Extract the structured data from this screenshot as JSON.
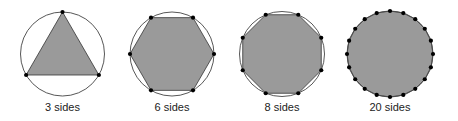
{
  "figure": {
    "panels": [
      {
        "sides": 3,
        "label": "3 sides",
        "cx": 62.5,
        "cy": 54,
        "r": 42
      },
      {
        "sides": 6,
        "label": "6 sides",
        "cx": 172,
        "cy": 54,
        "r": 42
      },
      {
        "sides": 8,
        "label": "8 sides",
        "cx": 282,
        "cy": 54,
        "r": 42.5
      },
      {
        "sides": 20,
        "label": "20 sides",
        "cx": 390,
        "cy": 54,
        "r": 43
      }
    ],
    "colors": {
      "polygon_fill": "#9a9a9a",
      "polygon_stroke": "#333333",
      "circle_stroke": "#444444",
      "vertex": "#000000"
    }
  }
}
